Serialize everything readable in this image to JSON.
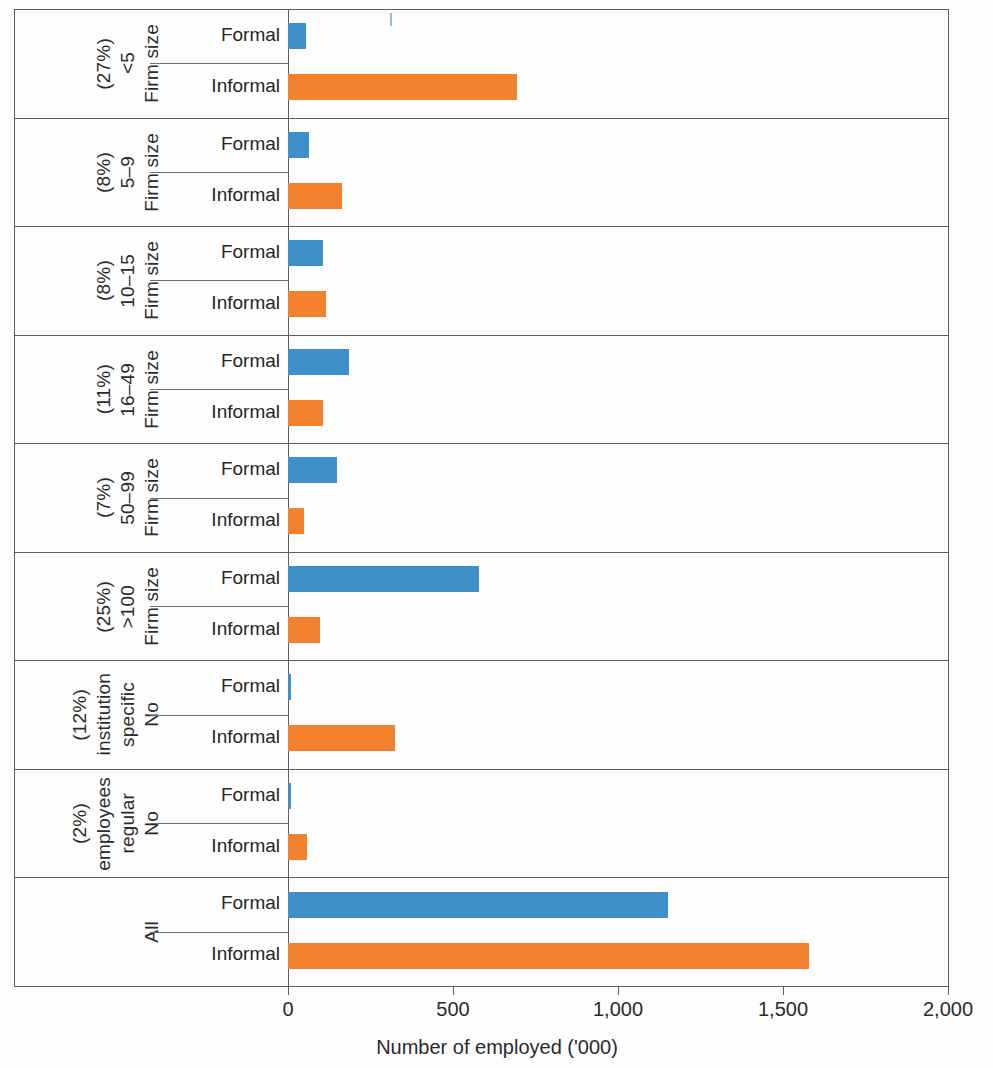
{
  "chart_data": {
    "type": "bar",
    "orientation": "horizontal",
    "title": "",
    "subtitle": "",
    "xlabel": "Number of employed  ('000)",
    "ylabel": "",
    "xlim": [
      0,
      2000
    ],
    "xticks": [
      0,
      500,
      1000,
      1500,
      2000
    ],
    "xtick_labels": [
      "0",
      "500",
      "1,000",
      "1,500",
      "2,000"
    ],
    "grid": false,
    "legend": null,
    "series": [
      {
        "name": "Formal",
        "color": "#3f8fc9",
        "values": [
          55,
          65,
          105,
          185,
          148,
          580,
          10,
          10,
          1150
        ]
      },
      {
        "name": "Informal",
        "color": "#f3822e",
        "values": [
          695,
          165,
          115,
          105,
          48,
          98,
          325,
          58,
          1580
        ]
      }
    ],
    "categories": [
      "Firm size <5 (27%)",
      "Firm size 5–9 (8%)",
      "Firm size 10–15 (8%)",
      "Firm size 16–49 (11%)",
      "Firm size 50–99 (7%)",
      "Firm size >100 (25%)",
      "No specific institution (12%)",
      "No regular employees (2%)",
      "All"
    ]
  },
  "axis": {
    "x_title": "Number of employed  ('000)",
    "ticks": [
      {
        "label": "0",
        "value": 0
      },
      {
        "label": "500",
        "value": 500
      },
      {
        "label": "1,000",
        "value": 1000
      },
      {
        "label": "1,500",
        "value": 1500
      },
      {
        "label": "2,000",
        "value": 2000
      }
    ]
  },
  "sub_labels": {
    "formal": "Formal",
    "informal": "Informal"
  },
  "groups": [
    {
      "id": "firm-size-lt5",
      "parts": [
        "Firm size",
        "<5",
        "(27%)"
      ],
      "formal": 55,
      "informal": 695
    },
    {
      "id": "firm-size-5-9",
      "parts": [
        "Firm size",
        "5–9",
        "(8%)"
      ],
      "formal": 65,
      "informal": 165
    },
    {
      "id": "firm-size-10-15",
      "parts": [
        "Firm size",
        "10–15",
        "(8%)"
      ],
      "formal": 105,
      "informal": 115
    },
    {
      "id": "firm-size-16-49",
      "parts": [
        "Firm size",
        "16–49",
        "(11%)"
      ],
      "formal": 185,
      "informal": 105
    },
    {
      "id": "firm-size-50-99",
      "parts": [
        "Firm size",
        "50–99",
        "(7%)"
      ],
      "formal": 148,
      "informal": 48
    },
    {
      "id": "firm-size-gt100",
      "parts": [
        "Firm size",
        ">100",
        "(25%)"
      ],
      "formal": 580,
      "informal": 98
    },
    {
      "id": "no-specific-institution",
      "parts": [
        "No",
        "specific",
        "institution",
        "(12%)"
      ],
      "formal": 10,
      "informal": 325
    },
    {
      "id": "no-regular-employees",
      "parts": [
        "No",
        "regular",
        "employees",
        "(2%)"
      ],
      "formal": 10,
      "informal": 58
    },
    {
      "id": "all",
      "parts": [
        "All"
      ],
      "formal": 1150,
      "informal": 1580
    }
  ],
  "colors": {
    "formal": "#3f8fc9",
    "informal": "#f3822e",
    "rule": "#5d5d5d"
  }
}
